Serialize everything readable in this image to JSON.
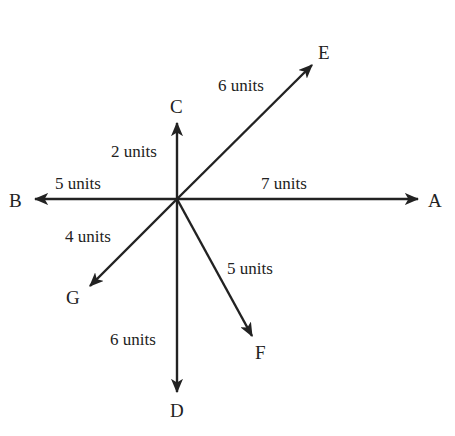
{
  "diagram": {
    "type": "vector-diagram",
    "origin": {
      "x": 177,
      "y": 199
    },
    "stroke_color": "#222222",
    "vectors": [
      {
        "id": "A",
        "label": "A",
        "magnitude_label": "7 units",
        "tip": {
          "x": 418,
          "y": 199
        }
      },
      {
        "id": "B",
        "label": "B",
        "magnitude_label": "5 units",
        "tip": {
          "x": 35,
          "y": 199
        }
      },
      {
        "id": "C",
        "label": "C",
        "magnitude_label": "2 units",
        "tip": {
          "x": 177,
          "y": 123
        }
      },
      {
        "id": "D",
        "label": "D",
        "magnitude_label": "6 units",
        "tip": {
          "x": 177,
          "y": 392
        }
      },
      {
        "id": "E",
        "label": "E",
        "magnitude_label": "6 units",
        "tip": {
          "x": 312,
          "y": 65
        }
      },
      {
        "id": "F",
        "label": "F",
        "magnitude_label": "5 units",
        "tip": {
          "x": 252,
          "y": 336
        }
      },
      {
        "id": "G",
        "label": "G",
        "magnitude_label": "4 units",
        "tip": {
          "x": 90,
          "y": 286
        }
      }
    ]
  }
}
